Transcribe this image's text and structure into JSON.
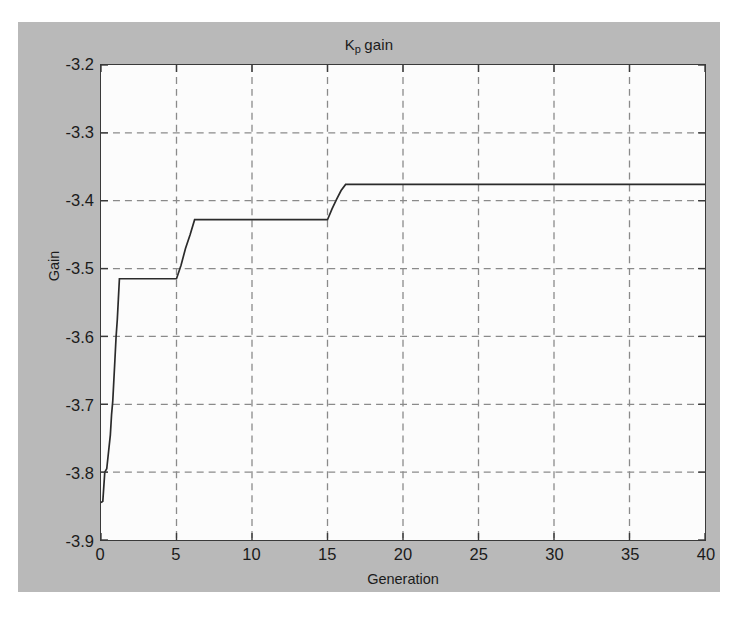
{
  "figure": {
    "background_color": "#b9b9b9",
    "plot_background_color": "#fcfcfc",
    "axis_color": "#3a3a3a",
    "grid_color": "#8a8a8a",
    "line_color": "#2b2b2b"
  },
  "chart_data": {
    "type": "line",
    "title_base": "K",
    "title_subscript": "p",
    "title_tail": "gain",
    "xlabel": "Generation",
    "ylabel": "Gain",
    "xlim": [
      0,
      40
    ],
    "ylim": [
      -3.9,
      -3.2
    ],
    "xticks": [
      0,
      5,
      10,
      15,
      20,
      25,
      30,
      35,
      40
    ],
    "xtick_labels": [
      "0",
      "5",
      "10",
      "15",
      "20",
      "25",
      "30",
      "35",
      "40"
    ],
    "yticks": [
      -3.2,
      -3.3,
      -3.4,
      -3.5,
      -3.6,
      -3.7,
      -3.8,
      -3.9
    ],
    "ytick_labels": [
      "-3.2",
      "-3.3",
      "-3.4",
      "-3.5",
      "-3.6",
      "-3.7",
      "-3.8",
      "-3.9"
    ],
    "grid": true,
    "grid_style": "dashed",
    "legend": null,
    "series": [
      {
        "name": "Kp gain",
        "x": [
          0,
          0.12,
          0.25,
          0.38,
          0.5,
          0.62,
          0.7,
          0.78,
          0.85,
          0.92,
          1.0,
          1.08,
          1.15,
          1.22,
          5.0,
          5.3,
          5.6,
          5.9,
          6.2,
          15.0,
          15.3,
          15.6,
          15.9,
          16.2,
          40
        ],
        "y": [
          -3.845,
          -3.843,
          -3.8,
          -3.795,
          -3.77,
          -3.745,
          -3.715,
          -3.695,
          -3.665,
          -3.635,
          -3.6,
          -3.575,
          -3.545,
          -3.515,
          -3.515,
          -3.495,
          -3.47,
          -3.45,
          -3.428,
          -3.428,
          -3.412,
          -3.398,
          -3.385,
          -3.376,
          -3.376
        ]
      }
    ],
    "plateaus": [
      {
        "from_x": 1.22,
        "to_x": 5.0,
        "value": -3.515
      },
      {
        "from_x": 6.2,
        "to_x": 15.0,
        "value": -3.428
      },
      {
        "from_x": 16.2,
        "to_x": 40.0,
        "value": -3.376
      }
    ],
    "start_value": -3.845,
    "final_value": -3.376
  }
}
